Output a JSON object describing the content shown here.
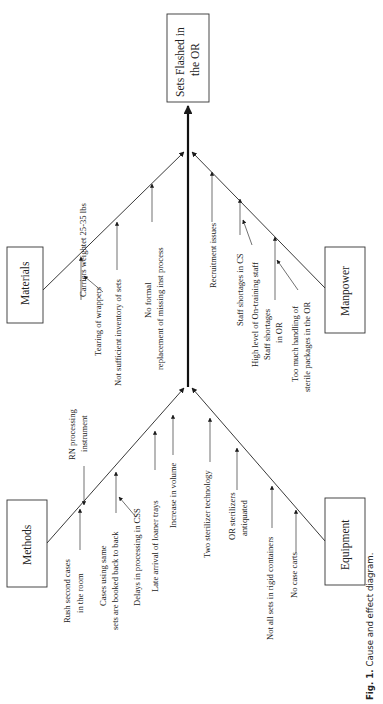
{
  "diagram": {
    "type": "cause-and-effect (fishbone)",
    "orientation": "rotated 90 degrees counter-clockwise",
    "effect": {
      "line1": "Sets Flashed in",
      "line2": "the OR"
    },
    "categories": {
      "materials": {
        "label": "Materials",
        "causes": [
          {
            "text": "Carriers weightet 25-35 lbs"
          },
          {
            "text": "Tearing of wrappers"
          },
          {
            "text": "Not sufficient inventory of sets"
          },
          {
            "line1": "No formal",
            "line2": "replacement of missing inst process"
          }
        ]
      },
      "manpower": {
        "label": "Manpower",
        "causes": [
          {
            "text": "Recruitment issues"
          },
          {
            "text": "Staff shortages in CS"
          },
          {
            "text": "High level of On-training staff"
          },
          {
            "line1": "Staff shortages",
            "line2": "in OR"
          },
          {
            "line1": "Too much handling of",
            "line2": "sterile packages in the OR"
          }
        ]
      },
      "methods": {
        "label": "Methods",
        "causes": [
          {
            "line1": "RN processing",
            "line2": "instrument"
          },
          {
            "line1": "Rush second cases",
            "line2": "in the room"
          },
          {
            "line1": "Cases using same",
            "line2": "sets are booked back to back"
          },
          {
            "text": "Delays in processing in CSS"
          },
          {
            "text": "Late arrival of loaner trays"
          },
          {
            "text": "Increase in volume"
          }
        ]
      },
      "equipment": {
        "label": "Equipment",
        "causes": [
          {
            "text": "Two sterilizer technology"
          },
          {
            "line1": "OR sterilizers",
            "line2": "antiquated"
          },
          {
            "text": "Not all sets in rigid containers"
          },
          {
            "text": "No case carts"
          }
        ]
      }
    },
    "caption": {
      "prefix": "Fig. 1.",
      "text": "Cause and effect diagram."
    }
  }
}
